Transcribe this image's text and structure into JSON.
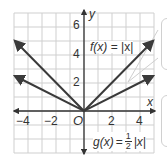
{
  "chart_data": {
    "type": "line",
    "title": "",
    "xlabel": "x",
    "ylabel": "y",
    "xlim": [
      -5,
      5
    ],
    "ylim": [
      -3,
      7
    ],
    "grid": true,
    "x_ticks": [
      "−4",
      "−2",
      "2",
      "4"
    ],
    "y_ticks": [
      "2",
      "4",
      "6"
    ],
    "origin_label": "O",
    "series": [
      {
        "name": "f(x) = |x|",
        "x": [
          -5,
          0,
          5
        ],
        "y": [
          5,
          0,
          5
        ]
      },
      {
        "name": "g(x) = ½|x|",
        "x": [
          -5,
          0,
          5
        ],
        "y": [
          2.5,
          0,
          2.5
        ]
      }
    ],
    "annotations": [
      {
        "text": "f(x) = |x|",
        "x": 2.2,
        "y": 4.3
      },
      {
        "text": "g(x) = ½|x|",
        "x": 2.4,
        "y": -1.8
      }
    ],
    "colors": {
      "line": "#3a3a3a",
      "grid": "#cfcfcf",
      "axis": "#333333",
      "callout_border": "#d0d0d0"
    }
  },
  "labels": {
    "x_axis": "x",
    "y_axis": "y",
    "origin": "O",
    "xt_m4": "−4",
    "xt_m2": "−2",
    "xt_2": "2",
    "xt_4": "4",
    "yt_2": "2",
    "yt_4": "4",
    "yt_6": "6",
    "f_name": "f(x)",
    "f_eq": "= |x|",
    "g_name": "g(x)",
    "g_eq_pre": "=",
    "g_num": "1",
    "g_den": "2",
    "g_abs": "|x|"
  }
}
